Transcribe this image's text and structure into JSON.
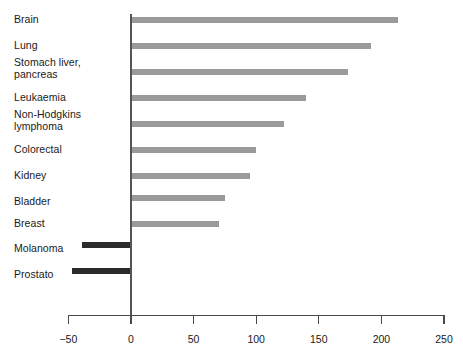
{
  "chart_data": {
    "type": "bar",
    "orientation": "horizontal",
    "title": "",
    "subtitle": "",
    "xlabel": "",
    "ylabel": "",
    "xlim": [
      -50,
      250
    ],
    "xticks": [
      -50,
      0,
      50,
      100,
      150,
      200,
      250
    ],
    "xticklabels": [
      "−50",
      "0",
      "50",
      "100",
      "150",
      "200",
      "250"
    ],
    "grid": false,
    "legend": false,
    "categories": [
      "Brain",
      "Lung",
      "Stomach liver,\npancreas",
      "Leukaemia",
      "Non-Hodgkins\nlymphoma",
      "Colorectal",
      "Kidney",
      "Bladder",
      "Breast",
      "Molanoma",
      "Prostato"
    ],
    "values": [
      213,
      192,
      173,
      140,
      122,
      100,
      95,
      75,
      70,
      -39,
      -47
    ],
    "bar_colors": [
      "#9a9a9a",
      "#9a9a9a",
      "#9a9a9a",
      "#9a9a9a",
      "#9a9a9a",
      "#9a9a9a",
      "#9a9a9a",
      "#9a9a9a",
      "#9a9a9a",
      "#2b2b2b",
      "#2b2b2b"
    ],
    "colors": {
      "positive_bar": "#9a9a9a",
      "negative_bar": "#2b2b2b",
      "axis": "#4a4a4a",
      "text": "#1a1a1a",
      "background": "#ffffff"
    }
  }
}
